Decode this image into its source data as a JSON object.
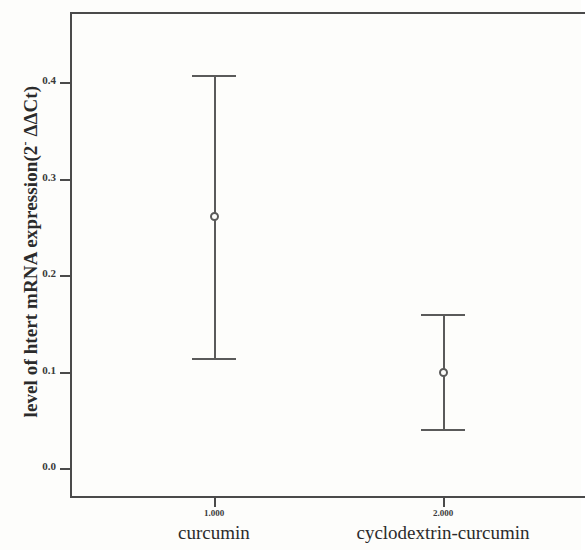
{
  "chart_data": {
    "type": "scatter",
    "title": "",
    "subtitle": "",
    "xlabel": "",
    "ylabel": "level of htert mRNA expression(2- ΔΔCt)",
    "ylabel_parts": {
      "main_before": "level of htert mRNA expression(2",
      "superscript": "-",
      "main_after": " ΔΔCt)"
    },
    "grid": false,
    "legend": null,
    "error_bar_kind": "capped",
    "marker": "open-circle",
    "ylim": [
      -0.05,
      0.46
    ],
    "yticks": [
      0.0,
      0.1,
      0.2,
      0.3,
      0.4
    ],
    "ytick_labels": [
      "0.0",
      "0.1",
      "0.2",
      "0.3",
      "0.4"
    ],
    "xtick_values": [
      "1.000",
      "2.000"
    ],
    "categories": [
      "curcumin",
      "cyclodextrin-curcumin"
    ],
    "values": [
      0.261,
      0.1
    ],
    "error_low": [
      0.114,
      0.04
    ],
    "error_high": [
      0.407,
      0.16
    ],
    "series": [
      {
        "name": "htert mRNA expression",
        "points": [
          {
            "x_tick": "1.000",
            "category": "curcumin",
            "mean": 0.261,
            "ci_low": 0.114,
            "ci_high": 0.407
          },
          {
            "x_tick": "2.000",
            "category": "cyclodextrin-curcumin",
            "mean": 0.1,
            "ci_low": 0.04,
            "ci_high": 0.16
          }
        ]
      }
    ],
    "colors": {
      "axis": "#4a4a4a",
      "error_bar": "#5a5a5a",
      "marker_fill": "#fdfdfb",
      "text": "#2b2b2b",
      "background": "#fdfdfb"
    }
  }
}
